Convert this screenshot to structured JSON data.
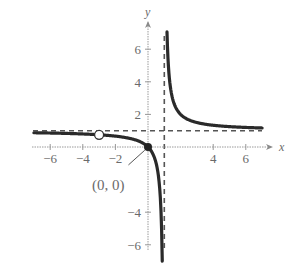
{
  "chart_data": {
    "type": "line",
    "title": "",
    "xlabel": "x",
    "ylabel": "y",
    "xlim": [
      -7,
      7.5
    ],
    "ylim": [
      -7,
      7.5
    ],
    "grid": false,
    "x_ticks": [
      -6,
      -4,
      -2,
      4,
      6
    ],
    "x_tick_labels": [
      "−6",
      "−4",
      "−2",
      "4",
      "6"
    ],
    "y_ticks": [
      6,
      4,
      2,
      -4,
      -6
    ],
    "y_tick_labels": [
      "6",
      "4",
      "2",
      "−4",
      "−6"
    ],
    "function": "f(x) = x/(x−1), x ≠ −3",
    "vertical_asymptote": 1,
    "horizontal_asymptote": 1,
    "series": [
      {
        "name": "left branch",
        "x": [
          -7,
          -6,
          -5,
          -4,
          -3,
          -2,
          -1,
          0,
          0.5,
          0.7,
          0.8,
          0.875
        ],
        "values": [
          0.875,
          0.857,
          0.833,
          0.8,
          0.75,
          0.667,
          0.5,
          0,
          -1,
          -2.333,
          -4,
          -7
        ]
      },
      {
        "name": "right branch",
        "x": [
          1.16,
          1.25,
          1.5,
          2,
          3,
          4,
          5,
          6,
          7
        ],
        "values": [
          7.25,
          5,
          3,
          2,
          1.5,
          1.333,
          1.25,
          1.2,
          1.167
        ]
      }
    ],
    "points": [
      {
        "label": "(0, 0)",
        "x": 0,
        "y": 0,
        "style": "closed"
      },
      {
        "label": "",
        "x": -3,
        "y": 0.75,
        "style": "open"
      }
    ],
    "annotations": [
      {
        "text": "(0, 0)",
        "x": -1.6,
        "y": -1.3
      }
    ]
  }
}
